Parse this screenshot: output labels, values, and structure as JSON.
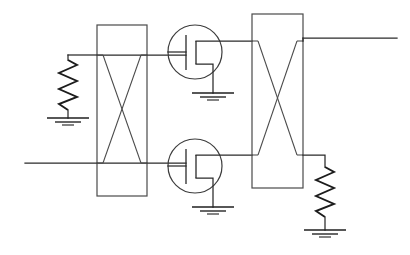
{
  "diagram": {
    "style": "hand-drawn pencil line art, black on white",
    "canvas": {
      "width": 410,
      "height": 255,
      "background": "#ffffff"
    },
    "line_color": "#2a2a2a"
  },
  "components": [
    {
      "id": "r-left",
      "type": "resistor",
      "name": "left-resistor",
      "orientation": "vertical",
      "top": {
        "x": 68,
        "y": 55
      },
      "bottom": {
        "x": 68,
        "y": 110
      },
      "zigzags": 6,
      "amplitude": 9
    },
    {
      "id": "gnd-left",
      "type": "ground",
      "name": "left-ground",
      "at": {
        "x": 68,
        "y": 118
      },
      "bars": 3
    },
    {
      "id": "box-left",
      "type": "crossover-box",
      "name": "left-crossover-box",
      "rect": {
        "x": 97,
        "y": 25,
        "w": 50,
        "h": 171
      },
      "cross": "bowtie",
      "taps": [
        {
          "side": "left",
          "y": 55
        },
        {
          "side": "right",
          "y": 55
        },
        {
          "side": "left",
          "y": 163
        },
        {
          "side": "right",
          "y": 163
        }
      ]
    },
    {
      "id": "q-top",
      "type": "transistor",
      "name": "upper-transistor",
      "circle": {
        "cx": 195,
        "cy": 52,
        "r": 27
      },
      "gate_lead_from_x": 147,
      "gate_bar": {
        "x": 186,
        "y1": 35,
        "y2": 70
      },
      "channel_bar": {
        "x": 196,
        "y1": 41,
        "y2": 64
      },
      "drain_to": {
        "x": 252,
        "y": 41
      },
      "source_to": {
        "x": 213,
        "y": 93
      }
    },
    {
      "id": "gnd-top",
      "type": "ground",
      "name": "upper-transistor-ground",
      "at": {
        "x": 213,
        "y": 93
      },
      "bars": 3
    },
    {
      "id": "q-bottom",
      "type": "transistor",
      "name": "lower-transistor",
      "circle": {
        "cx": 195,
        "cy": 166,
        "r": 27
      },
      "gate_lead_from_x": 147,
      "gate_bar": {
        "x": 186,
        "y1": 149,
        "y2": 184
      },
      "channel_bar": {
        "x": 196,
        "y1": 155,
        "y2": 178
      },
      "drain_to": {
        "x": 252,
        "y": 155
      },
      "source_to": {
        "x": 213,
        "y": 207
      }
    },
    {
      "id": "gnd-bottom",
      "type": "ground",
      "name": "lower-transistor-ground",
      "at": {
        "x": 213,
        "y": 207
      },
      "bars": 3
    },
    {
      "id": "box-right",
      "type": "crossover-box",
      "name": "right-crossover-box",
      "rect": {
        "x": 252,
        "y": 14,
        "w": 51,
        "h": 174
      },
      "cross": "bowtie",
      "taps": [
        {
          "side": "left",
          "y": 41
        },
        {
          "side": "right",
          "y": 41
        },
        {
          "side": "left",
          "y": 155
        },
        {
          "side": "right",
          "y": 155
        }
      ]
    },
    {
      "id": "r-right",
      "type": "resistor",
      "name": "right-resistor",
      "orientation": "vertical",
      "top": {
        "x": 325,
        "y": 165
      },
      "bottom": {
        "x": 325,
        "y": 222
      },
      "zigzags": 6,
      "amplitude": 9
    },
    {
      "id": "gnd-right",
      "type": "ground",
      "name": "right-ground",
      "at": {
        "x": 325,
        "y": 230
      },
      "bars": 3
    }
  ],
  "wires": [
    {
      "name": "upper-left-rail",
      "from": {
        "x": 68,
        "y": 55
      },
      "to": {
        "x": 186,
        "y": 55
      }
    },
    {
      "name": "lower-left-rail",
      "from": {
        "x": 25,
        "y": 163
      },
      "to": {
        "x": 186,
        "y": 163
      }
    },
    {
      "name": "upper-right-rail",
      "from": {
        "x": 303,
        "y": 38
      },
      "to": {
        "x": 397,
        "y": 38
      }
    },
    {
      "name": "right-resistor-tap",
      "from": {
        "x": 303,
        "y": 165
      },
      "to": {
        "x": 325,
        "y": 165
      }
    },
    {
      "name": "upper-drain-wire",
      "from": {
        "x": 213,
        "y": 41
      },
      "to": {
        "x": 252,
        "y": 41
      }
    },
    {
      "name": "lower-drain-wire",
      "from": {
        "x": 213,
        "y": 155
      },
      "to": {
        "x": 252,
        "y": 155
      }
    }
  ]
}
